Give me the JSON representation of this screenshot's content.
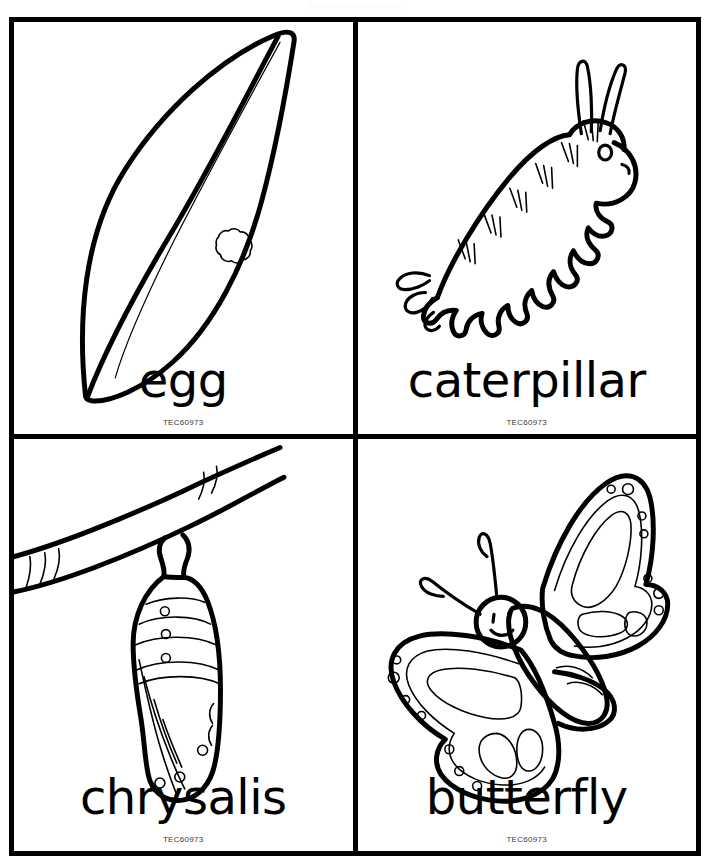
{
  "sheet": {
    "title": "Butterfly Life Cycle Flashcards",
    "ghost_text": "butterfly life cycle cards",
    "background_color": "#ffffff",
    "ink_color": "#000000",
    "grid": {
      "columns": 2,
      "rows": 2
    }
  },
  "cards": [
    {
      "id": "egg",
      "label": "egg",
      "code": "TEC60973",
      "illustration": "leaf-with-egg-cluster",
      "position": "top-left"
    },
    {
      "id": "caterpillar",
      "label": "caterpillar",
      "code": "TEC60973",
      "illustration": "caterpillar-with-antennae",
      "position": "top-right"
    },
    {
      "id": "chrysalis",
      "label": "chrysalis",
      "code": "TEC60973",
      "illustration": "chrysalis-hanging-from-branch",
      "position": "bottom-left"
    },
    {
      "id": "butterfly",
      "label": "butterfly",
      "code": "TEC60973",
      "illustration": "butterfly-with-spotted-wings",
      "position": "bottom-right"
    }
  ]
}
